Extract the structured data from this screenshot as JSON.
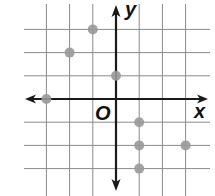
{
  "chart_data": {
    "type": "scatter",
    "title": "",
    "xlabel": "x",
    "ylabel": "y",
    "origin_label": "O",
    "xlim": [
      -3,
      3
    ],
    "ylim": [
      -3,
      3
    ],
    "grid": true,
    "points": [
      {
        "x": -1,
        "y": 3
      },
      {
        "x": -2,
        "y": 2
      },
      {
        "x": 0,
        "y": 1
      },
      {
        "x": -3,
        "y": 0
      },
      {
        "x": 1,
        "y": -1
      },
      {
        "x": 1,
        "y": -2
      },
      {
        "x": 3,
        "y": -2
      },
      {
        "x": 1,
        "y": -3
      }
    ],
    "point_color": "#999999",
    "axis_color": "#1a1a1a",
    "grid_color": "#8a8a8a"
  }
}
